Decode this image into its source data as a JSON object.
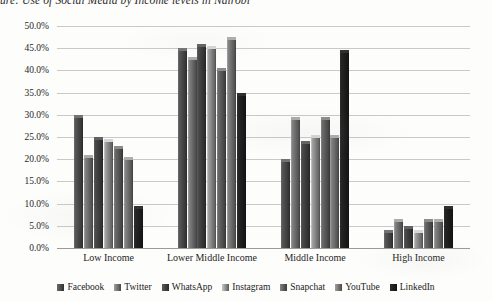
{
  "chart_data": {
    "type": "bar",
    "title": "ure: Use of Social Media by Income levels in Nairobi",
    "xlabel": "",
    "ylabel": "",
    "ylim": [
      0,
      50
    ],
    "ytick_labels": [
      "50.0%",
      "45.0%",
      "40.0%",
      "35.0%",
      "30.0%",
      "25.0%",
      "20.0%",
      "15.0%",
      "10.0%",
      "5.0%",
      "0.0%"
    ],
    "ytick_values": [
      50,
      45,
      40,
      35,
      30,
      25,
      20,
      15,
      10,
      5,
      0
    ],
    "grid": true,
    "legend_position": "bottom",
    "categories": [
      "Low Income",
      "Lower Middle Income",
      "Middle Income",
      "High Income"
    ],
    "series": [
      {
        "name": "Facebook",
        "color": "#4a4a4a",
        "values": [
          30.0,
          45.0,
          20.0,
          4.0
        ]
      },
      {
        "name": "Twitter",
        "color": "#6e6e6e",
        "values": [
          21.0,
          43.0,
          29.5,
          6.5
        ]
      },
      {
        "name": "WhatsApp",
        "color": "#3f3f3f",
        "values": [
          25.0,
          46.0,
          24.0,
          5.0
        ]
      },
      {
        "name": "Instagram",
        "color": "#8a8a8a",
        "values": [
          24.5,
          45.5,
          25.5,
          4.0
        ]
      },
      {
        "name": "Snapchat",
        "color": "#5a5a5a",
        "values": [
          23.0,
          40.5,
          29.5,
          6.5
        ]
      },
      {
        "name": "YouTube",
        "color": "#707070",
        "values": [
          20.5,
          47.5,
          25.5,
          6.5
        ]
      },
      {
        "name": "LinkedIn",
        "color": "#1f1f1f",
        "values": [
          9.5,
          35.0,
          44.5,
          9.5
        ]
      }
    ]
  }
}
